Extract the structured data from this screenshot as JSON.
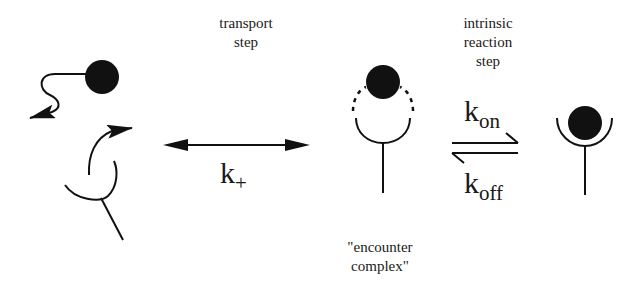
{
  "labels": {
    "transport_step": [
      "transport",
      "step"
    ],
    "intrinsic_step": [
      "intrinsic",
      "reaction",
      "step"
    ],
    "encounter_complex": [
      "\"encounter",
      "complex\""
    ]
  },
  "rate_constants": {
    "k_plus": {
      "base": "k",
      "sub": "+"
    },
    "k_on": {
      "base": "k",
      "sub": "on"
    },
    "k_off": {
      "base": "k",
      "sub": "off"
    }
  },
  "states": [
    {
      "name": "separated",
      "description": "free ligand and receptor with diffusion arrows"
    },
    {
      "name": "encounter complex",
      "description": "ligand adjacent to receptor with dotted binding arc"
    },
    {
      "name": "bound",
      "description": "ligand seated in receptor cup"
    }
  ],
  "colors": {
    "ink": "#111111",
    "background": "#ffffff"
  }
}
